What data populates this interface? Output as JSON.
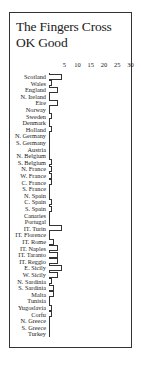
{
  "title_line1": "The Fingers Cross",
  "title_line2": "OK Good",
  "chart_data": {
    "type": "bar",
    "orientation": "horizontal",
    "title": "The Fingers Cross OK Good",
    "xlabel": "",
    "ylabel": "",
    "xticks": [
      "5",
      "10",
      "15",
      "20",
      "25",
      "30"
    ],
    "xlim": [
      0,
      30
    ],
    "grid": false,
    "legend": null,
    "categories": [
      "Scotland",
      "Wales",
      "England",
      "N. Ireland",
      "Eire",
      "Norway",
      "Sweden",
      "Denmark",
      "Holland",
      "N. Germany",
      "S. Germany",
      "Austria",
      "N. Belgium",
      "S. Belgium",
      "N. France",
      "W. France",
      "C. France",
      "S. France",
      "N. Spain",
      "C. Spain",
      "S. Spain",
      "Canaries",
      "Portugal",
      "IT. Turin",
      "IT. Florence",
      "IT. Rome",
      "IT. Naples",
      "IT. Taranto",
      "IT. Reggio",
      "E. Sicily",
      "W. Sicily",
      "N. Sardinia",
      "S. Sardinia",
      "Malta",
      "Tunisia",
      "Yugoslavia",
      "Corfu",
      "N. Greece",
      "S. Greece",
      "Turkey"
    ],
    "values": [
      5,
      1,
      3.5,
      0,
      3.5,
      0,
      1,
      0,
      1,
      0,
      0,
      0,
      0,
      1,
      1,
      1,
      1,
      0,
      0,
      1,
      1,
      0,
      0,
      5,
      0,
      2,
      3.5,
      3.5,
      3.5,
      5,
      3.5,
      1,
      2,
      2,
      0,
      1,
      1,
      0,
      0,
      0
    ]
  }
}
